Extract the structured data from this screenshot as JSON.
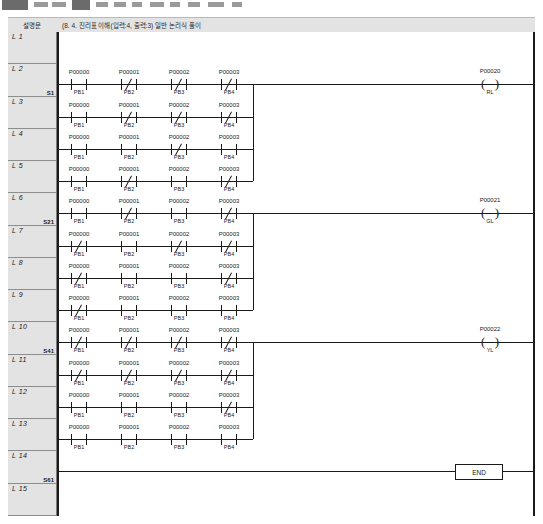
{
  "header": {
    "comment_column_label": "설명문",
    "program_description": "(8. 4. 진리표 이해(입력:4, 출력:3) 일반 논리식 풀이"
  },
  "gutter": {
    "rows": [
      {
        "label": "L 1",
        "step": ""
      },
      {
        "label": "L 2",
        "step": "S1"
      },
      {
        "label": "L 3",
        "step": ""
      },
      {
        "label": "L 4",
        "step": ""
      },
      {
        "label": "L 5",
        "step": ""
      },
      {
        "label": "L 6",
        "step": "S21"
      },
      {
        "label": "L 7",
        "step": ""
      },
      {
        "label": "L 8",
        "step": ""
      },
      {
        "label": "L 9",
        "step": ""
      },
      {
        "label": "L 10",
        "step": "S41"
      },
      {
        "label": "L 11",
        "step": ""
      },
      {
        "label": "L 12",
        "step": ""
      },
      {
        "label": "L 13",
        "step": ""
      },
      {
        "label": "L 14",
        "step": "S61"
      },
      {
        "label": "L 15",
        "step": ""
      }
    ]
  },
  "ladder": {
    "contact_addresses": [
      "P00000",
      "P00001",
      "P00002",
      "P00003"
    ],
    "contact_tags": [
      "PB1",
      "PB2",
      "PB3",
      "PB4"
    ],
    "groups": [
      {
        "name": "group-rl",
        "coil": {
          "address": "P00020",
          "tag": "RL"
        },
        "rungs": [
          {
            "line": "L 2",
            "contacts": [
              "NO",
              "NC",
              "NC",
              "NC"
            ]
          },
          {
            "line": "L 3",
            "contacts": [
              "NO",
              "NC",
              "NC",
              "NC"
            ]
          },
          {
            "line": "L 4",
            "contacts": [
              "NO",
              "NO",
              "NC",
              "NO"
            ]
          },
          {
            "line": "L 5",
            "contacts": [
              "NO",
              "NC",
              "NO",
              "NC"
            ]
          }
        ]
      },
      {
        "name": "group-gl",
        "coil": {
          "address": "P00021",
          "tag": "GL"
        },
        "rungs": [
          {
            "line": "L 6",
            "contacts": [
              "NO",
              "NC",
              "NO",
              "NC"
            ]
          },
          {
            "line": "L 7",
            "contacts": [
              "NC",
              "NO",
              "NC",
              "NC"
            ]
          },
          {
            "line": "L 8",
            "contacts": [
              "NC",
              "NO",
              "NO",
              "NC"
            ]
          },
          {
            "line": "L 9",
            "contacts": [
              "NC",
              "NO",
              "NO",
              "NO"
            ]
          }
        ]
      },
      {
        "name": "group-yl",
        "coil": {
          "address": "P00022",
          "tag": "YL"
        },
        "rungs": [
          {
            "line": "L 10",
            "contacts": [
              "NC",
              "NC",
              "NC",
              "NC"
            ]
          },
          {
            "line": "L 11",
            "contacts": [
              "NC",
              "NC",
              "NC",
              "NC"
            ]
          },
          {
            "line": "L 12",
            "contacts": [
              "NO",
              "NO",
              "NO",
              "NC"
            ]
          },
          {
            "line": "L 13",
            "contacts": [
              "NO",
              "NO",
              "NO",
              "NO"
            ]
          }
        ]
      }
    ],
    "end_instruction": {
      "label": "END",
      "line": "L 14"
    }
  },
  "colors": {
    "wire": "#1a1a1a",
    "gutter_background": "#e3e3e3",
    "header_background": "#e3e3e3",
    "grid_line": "#8d8d8d"
  }
}
